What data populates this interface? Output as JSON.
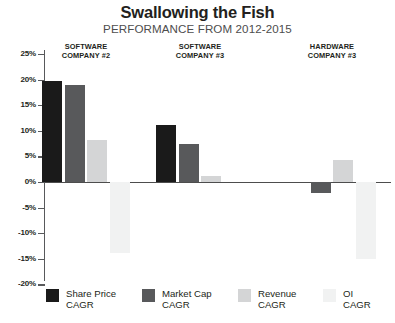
{
  "header": {
    "title": "Swallowing the Fish",
    "subtitle": "PERFORMANCE FROM 2012-2015"
  },
  "chart_data": {
    "type": "bar",
    "title": "Swallowing the Fish",
    "subtitle": "PERFORMANCE FROM 2012-2015",
    "xlabel": "",
    "ylabel": "",
    "ylim": [
      -20,
      25
    ],
    "ytick_labels": [
      "25%",
      "20%",
      "15%",
      "10%",
      "5%",
      "0%",
      "-5%",
      "-10%",
      "-15%",
      "-20%"
    ],
    "ytick_values": [
      25,
      20,
      15,
      10,
      5,
      0,
      -5,
      -10,
      -15,
      -20
    ],
    "grid": false,
    "legend_position": "bottom",
    "value_unit": "%",
    "categories": [
      "SOFTWARE\nCOMPANY #2",
      "SOFTWARE\nCOMPANY #3",
      "HARDWARE\nCOMPANY #3"
    ],
    "series": [
      {
        "name": "Share Price\nCAGR",
        "color": "#1a1a1a",
        "values": [
          19.8,
          11.2,
          0
        ]
      },
      {
        "name": "Market Cap\nCAGR",
        "color": "#58595b",
        "values": [
          18.9,
          7.4,
          -2.1
        ]
      },
      {
        "name": "Revenue\nCAGR",
        "color": "#d4d5d6",
        "values": [
          8.2,
          1.1,
          4.2
        ]
      },
      {
        "name": "OI\nCAGR",
        "color": "#f1f2f2",
        "values": [
          -13.8,
          0,
          -15.0
        ]
      }
    ]
  },
  "groups": [
    {
      "line1": "SOFTWARE",
      "line2": "COMPANY #2"
    },
    {
      "line1": "SOFTWARE",
      "line2": "COMPANY #3"
    },
    {
      "line1": "HARDWARE",
      "line2": "COMPANY #3"
    }
  ],
  "legend": [
    {
      "label": "Share Price\nCAGR",
      "color": "#1a1a1a"
    },
    {
      "label": "Market Cap\nCAGR",
      "color": "#58595b"
    },
    {
      "label": "Revenue\nCAGR",
      "color": "#d4d5d6"
    },
    {
      "label": "OI\nCAGR",
      "color": "#f1f2f2"
    }
  ]
}
